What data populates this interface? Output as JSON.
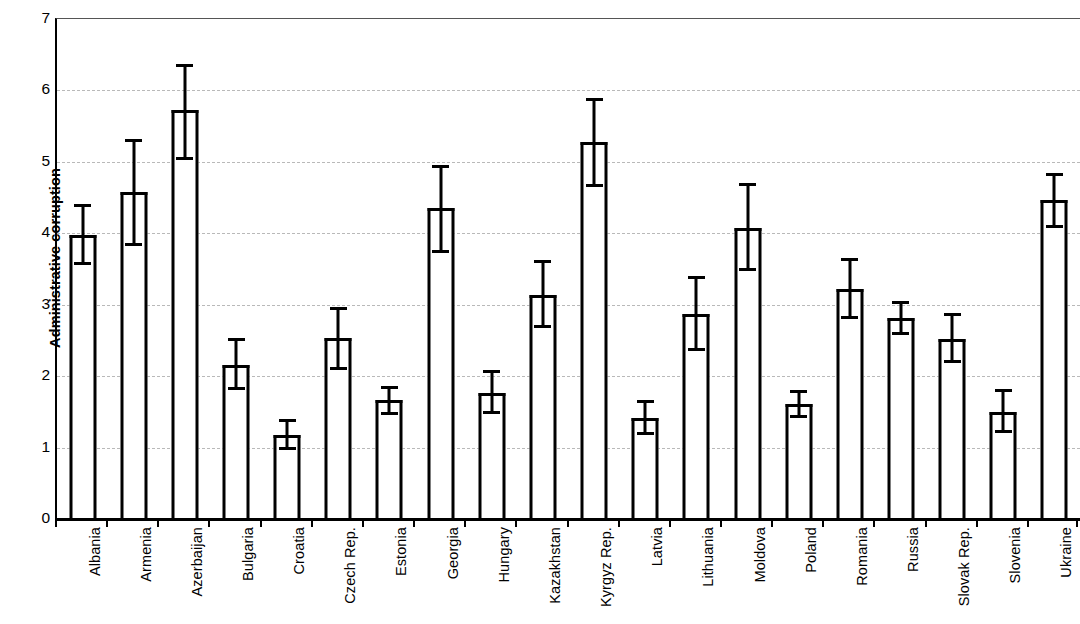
{
  "chart_data": {
    "type": "bar",
    "title": "",
    "xlabel": "",
    "ylabel": "Administrative corruption",
    "ylim": [
      0,
      7
    ],
    "yticks": [
      0,
      1,
      2,
      3,
      4,
      5,
      6,
      7
    ],
    "ytick_labels": [
      "0",
      "1",
      "2",
      "3",
      "4",
      "5",
      "6",
      "7"
    ],
    "grid": true,
    "legend": "none",
    "error_bars": "vertical with caps",
    "categories": [
      "Albania",
      "Armenia",
      "Azerbaijan",
      "Bulgaria",
      "Croatia",
      "Czech Rep.",
      "Estonia",
      "Georgia",
      "Hungary",
      "Kazakhstan",
      "Kyrgyz Rep.",
      "Latvia",
      "Lithuania",
      "Moldova",
      "Poland",
      "Romania",
      "Russia",
      "Slovak Rep.",
      "Slovenia",
      "Ukraine"
    ],
    "values": [
      3.98,
      4.58,
      5.72,
      2.15,
      1.17,
      2.53,
      1.66,
      4.35,
      1.77,
      3.14,
      5.28,
      1.42,
      2.87,
      4.08,
      1.61,
      3.22,
      2.81,
      2.52,
      1.5,
      4.47
    ],
    "error_low": [
      3.55,
      3.82,
      5.02,
      1.8,
      0.97,
      2.08,
      1.46,
      3.73,
      1.47,
      2.67,
      4.65,
      1.18,
      2.35,
      3.47,
      1.42,
      2.8,
      2.57,
      2.18,
      1.2,
      4.08
    ],
    "error_high": [
      4.41,
      5.32,
      6.37,
      2.53,
      1.4,
      2.97,
      1.86,
      4.95,
      2.09,
      3.62,
      5.9,
      1.67,
      3.4,
      4.7,
      1.8,
      3.65,
      3.05,
      2.88,
      1.82,
      4.85
    ],
    "colors": {
      "bar_outline": "#000000",
      "bar_fill": "#ffffff",
      "gridline": "#b9b9b9",
      "axis": "#000000",
      "background": "#ffffff"
    }
  }
}
